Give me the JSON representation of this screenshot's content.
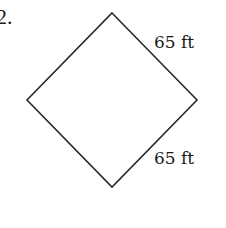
{
  "problem": {
    "number": "2."
  },
  "figure": {
    "shape": "square-rotated-45",
    "stroke_color": "#2a2a2a",
    "vertices": {
      "top": [
        112,
        13
      ],
      "right": [
        197,
        100
      ],
      "bottom": [
        112,
        187
      ],
      "left": [
        27,
        100
      ]
    },
    "labels": {
      "top_right_side": "65 ft",
      "bottom_right_side": "65 ft"
    }
  }
}
